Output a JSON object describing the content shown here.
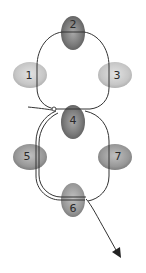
{
  "diagram": {
    "type": "bead-weaving-thread-path",
    "beads": [
      {
        "id": "bead-1",
        "label": "1",
        "cx": 30,
        "cy": 75,
        "rx": 17,
        "ry": 13,
        "shade": "light"
      },
      {
        "id": "bead-2",
        "label": "2",
        "cx": 73,
        "cy": 33,
        "rx": 12,
        "ry": 17,
        "shade": "dark"
      },
      {
        "id": "bead-3",
        "label": "3",
        "cx": 115,
        "cy": 75,
        "rx": 17,
        "ry": 13,
        "shade": "light"
      },
      {
        "id": "bead-4",
        "label": "4",
        "cx": 73,
        "cy": 122,
        "rx": 12,
        "ry": 17,
        "shade": "dark"
      },
      {
        "id": "bead-5",
        "label": "5",
        "cx": 30,
        "cy": 157,
        "rx": 17,
        "ry": 13,
        "shade": "medium"
      },
      {
        "id": "bead-6",
        "label": "6",
        "cx": 73,
        "cy": 200,
        "rx": 12,
        "ry": 17,
        "shade": "medium"
      },
      {
        "id": "bead-7",
        "label": "7",
        "cx": 115,
        "cy": 157,
        "rx": 17,
        "ry": 13,
        "shade": "medium"
      }
    ],
    "colors": {
      "thread": "#333333",
      "light_bead": "#c8c8c8",
      "medium_bead": "#9a9a9a",
      "dark_bead": "#777777",
      "background": "#ffffff"
    },
    "annotations": {
      "knot": "small loop knot left of bead 4",
      "arrow": "thread exits below bead 6 toward lower right"
    }
  }
}
